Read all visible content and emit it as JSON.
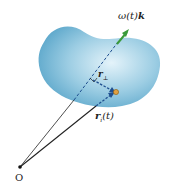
{
  "figure": {
    "labels": {
      "omega": "ω(t)",
      "k": "k",
      "r_perp_main": "r",
      "r_perp_sub": "⊥",
      "r_i_main": "r",
      "r_i_sub": "i",
      "r_i_arg": "(t)",
      "origin": "O"
    },
    "colors": {
      "body_light": "#d9eef7",
      "body_dark": "#5fa9cc",
      "axis_arrow": "#3a9a3a",
      "dashed_vector": "#1f4f8f",
      "particle": "#e0a040",
      "line": "#222222"
    }
  }
}
